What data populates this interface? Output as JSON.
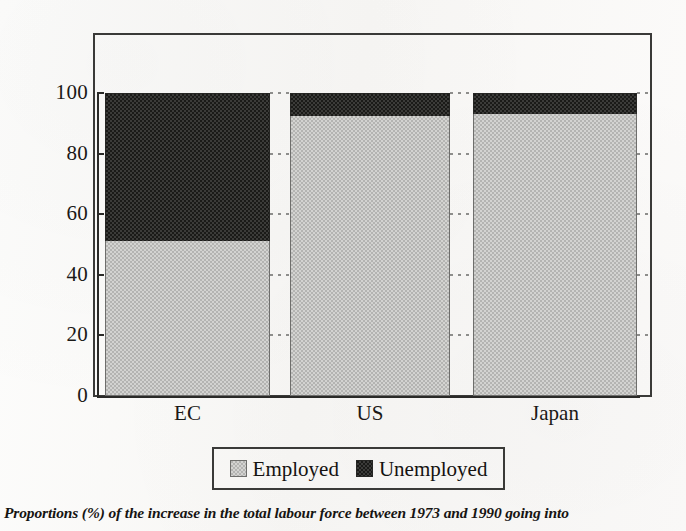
{
  "chart_data": {
    "type": "bar",
    "subtype": "stacked-100-percent",
    "title": "",
    "xlabel": "",
    "ylabel": "",
    "ylim": [
      0,
      100
    ],
    "yticks": [
      0,
      20,
      40,
      60,
      80,
      100
    ],
    "grid": "dotted-horizontal",
    "legend_position": "bottom-center",
    "categories": [
      "EC",
      "US",
      "Japan"
    ],
    "series": [
      {
        "name": "Employed",
        "color": "#c2c2c0",
        "values": [
          51,
          92.5,
          93
        ]
      },
      {
        "name": "Unemployed",
        "color": "#2b2b29",
        "values": [
          49,
          7.5,
          7
        ]
      }
    ],
    "caption": "Proportions (%) of the increase in the total labour force between 1973 and 1990 going into"
  },
  "axis": {
    "y_tick_labels": [
      "0",
      "20",
      "40",
      "60",
      "80",
      "100"
    ]
  },
  "legend": {
    "entries": [
      {
        "label": "Employed",
        "swatch": "employed"
      },
      {
        "label": "Unemployed",
        "swatch": "unemployed"
      }
    ]
  },
  "caption": {
    "text": "Proportions (%) of the increase in the total labour force between 1973 and 1990 going into"
  }
}
